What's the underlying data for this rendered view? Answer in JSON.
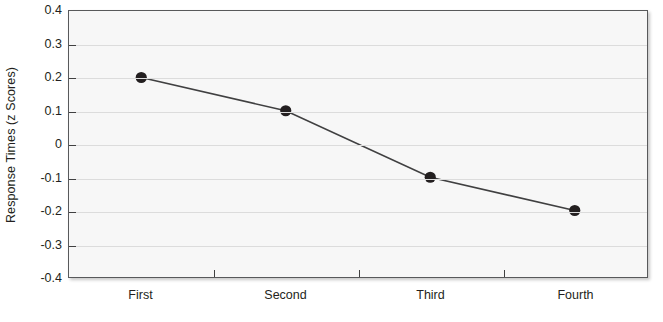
{
  "chart_data": {
    "type": "line",
    "title": "",
    "xlabel": "",
    "ylabel": "Response Times (z Scores)",
    "categories": [
      "First",
      "Second",
      "Third",
      "Fourth"
    ],
    "values": [
      0.2,
      0.1,
      -0.1,
      -0.2
    ],
    "series": [
      {
        "name": "Response Times",
        "values": [
          0.2,
          0.1,
          -0.1,
          -0.2
        ]
      }
    ],
    "ylim": [
      -0.4,
      0.4
    ],
    "ytick_labels": [
      "0.4",
      "0.3",
      "0.2",
      "0.1",
      "0",
      "-0.1",
      "-0.2",
      "-0.3",
      "-0.4"
    ],
    "ytick_values": [
      0.4,
      0.3,
      0.2,
      0.1,
      0,
      -0.1,
      -0.2,
      -0.3,
      -0.4
    ],
    "grid": true,
    "legend": "none",
    "colors": {
      "line": "#404041",
      "marker": "#231f20",
      "plot_background": "#f7f7f7",
      "gridline": "#dcdcdc",
      "axis": "#58595b",
      "text": "#231f20"
    }
  }
}
